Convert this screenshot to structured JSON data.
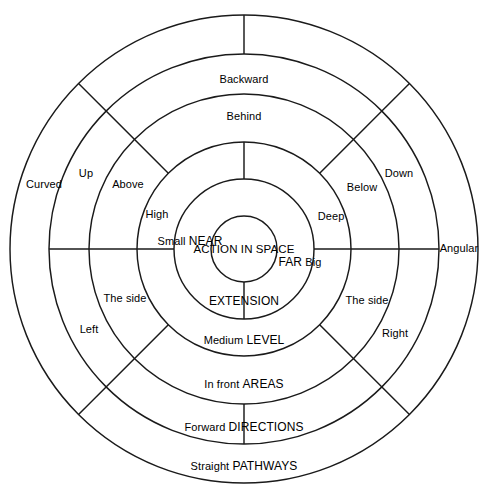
{
  "figure": {
    "type": "concentric-ring-diagram",
    "center_label_lines": [
      "ACTION",
      "IN",
      "SPACE"
    ],
    "center": {
      "x": 244,
      "y": 249
    },
    "circle_radii": [
      33,
      70,
      107,
      155,
      195,
      234
    ],
    "stroke_color": "#1a1a1a",
    "background_color": "#ffffff"
  },
  "core": {
    "line1": "ACTION",
    "line2": "IN",
    "line3": "SPACE"
  },
  "rings": {
    "extension": {
      "name": "EXTENSION",
      "near_small": "Small",
      "near_caps": "NEAR",
      "far_caps": "FAR",
      "far_big": "Big",
      "high": "High",
      "deep": "Deep"
    },
    "level": {
      "name": "LEVEL",
      "medium": "Medium",
      "above": "Above",
      "below": "Below"
    },
    "areas": {
      "name": "AREAS",
      "behind": "Behind",
      "in_front": "In front",
      "side_left": "The side",
      "side_right": "The side"
    },
    "directions": {
      "name": "DIRECTIONS",
      "backward": "Backward",
      "forward": "Forward",
      "up": "Up",
      "down": "Down",
      "left": "Left",
      "right": "Right"
    },
    "pathways": {
      "name": "PATHWAYS",
      "straight": "Straight",
      "curved": "Curved",
      "angular": "Angular"
    }
  }
}
